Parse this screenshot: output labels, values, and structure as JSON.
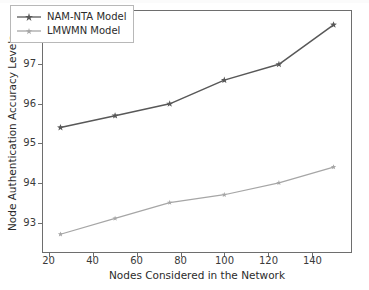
{
  "chart_data": {
    "type": "line",
    "title": "",
    "subtitle": "",
    "xlabel": "Nodes Considered in the Network",
    "ylabel": "Node Authentication Accuracy Levels",
    "x": [
      25,
      50,
      75,
      100,
      125,
      150
    ],
    "xlim": [
      17,
      158
    ],
    "ylim": [
      92.25,
      98.35
    ],
    "xticks": [
      20,
      40,
      60,
      80,
      100,
      120,
      140
    ],
    "xticklabels": [
      "20",
      "40",
      "60",
      "80",
      "100",
      "120",
      "140"
    ],
    "yticks": [
      93,
      94,
      95,
      96,
      97,
      98
    ],
    "yticklabels": [
      "93",
      "94",
      "95",
      "96",
      "97",
      "98"
    ],
    "grid": false,
    "legend_position": "upper left",
    "series": [
      {
        "name": "NAM-NTA Model",
        "color": "#585858",
        "marker": "star",
        "values": [
          95.4,
          95.7,
          96.0,
          96.6,
          97.0,
          98.0
        ]
      },
      {
        "name": "LMWMN Model",
        "color": "#a6a6a6",
        "marker": "star",
        "values": [
          92.7,
          93.1,
          93.5,
          93.7,
          94.0,
          94.4
        ]
      }
    ]
  },
  "legend": {
    "entries": [
      {
        "label": "NAM-NTA Model"
      },
      {
        "label": "LMWMN Model"
      }
    ]
  },
  "axes": {
    "x_title": "Nodes Considered in the Network",
    "y_title": "Node Authentication Accuracy Levels"
  },
  "colors": {
    "series_primary": "#585858",
    "series_secondary": "#a6a6a6",
    "axis": "#6e6e6e",
    "text": "#2b2b2b",
    "background": "#ffffff"
  }
}
